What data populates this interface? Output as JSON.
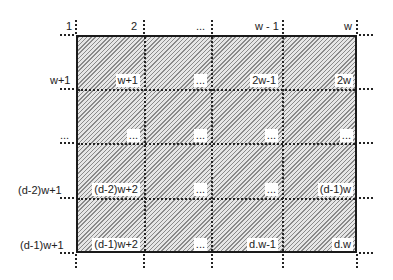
{
  "diagram": {
    "column_headers": [
      "1",
      "2",
      "...",
      "w - 1",
      "w"
    ],
    "row_headers": [
      "w+1",
      "...",
      "(d-2)w+1",
      "(d-1)w+1"
    ],
    "cells": [
      [
        "w+1",
        "...",
        "2w-1",
        "2w"
      ],
      [
        "...",
        "...",
        "...",
        "..."
      ],
      [
        "(d-2)w+2",
        "...",
        "...",
        "(d-1)w"
      ],
      [
        "(d-1)w+2",
        "...",
        "d.w-1",
        "d.w"
      ]
    ],
    "colors": {
      "border": "#1a1a1a",
      "hatch": "#8a8a8a",
      "fill": "#e6e6e6"
    }
  }
}
